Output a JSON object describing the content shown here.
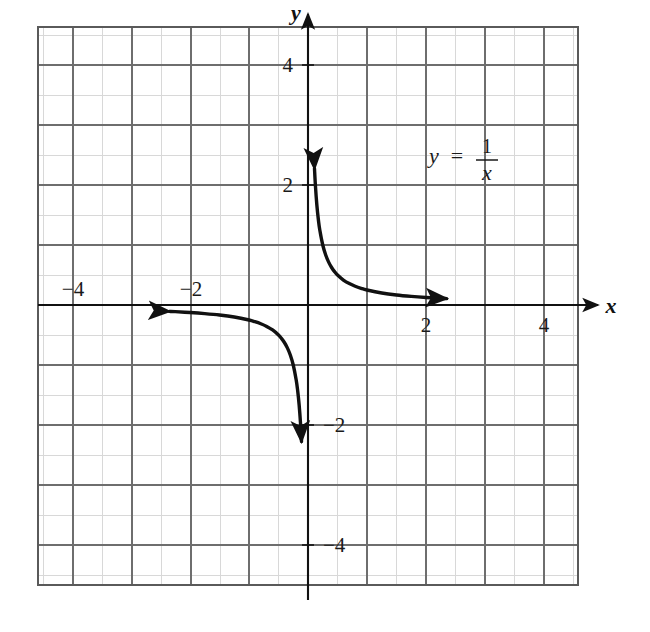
{
  "figure": {
    "background_color": "#ffffff",
    "curve_color": "#111111",
    "axis_color": "#111111",
    "major_grid_color": "#6e6e6e",
    "minor_grid_color": "#d8d8d8",
    "border_color": "#5a5a5a"
  },
  "axes": {
    "x_axis_name": "x",
    "y_axis_name": "y",
    "x_ticks_negative": [
      "−4",
      "−2"
    ],
    "x_ticks_positive": [
      "2",
      "4"
    ],
    "y_ticks_positive": [
      "4",
      "2"
    ],
    "y_ticks_negative": [
      "−2",
      "−4"
    ]
  },
  "equation": {
    "lhs": "y",
    "operator": "=",
    "numerator": "1",
    "denominator": "x",
    "full_text": "y = 1/x"
  },
  "chart_data": {
    "type": "line",
    "title": "",
    "subtitle": "",
    "xlabel": "x",
    "ylabel": "y",
    "xlim": [
      -5.0,
      5.0
    ],
    "ylim": [
      -5.1,
      5.1
    ],
    "grid": true,
    "minor_grid_step": 1,
    "major_grid_step": 2,
    "legend": "none",
    "xticks": [
      -4,
      -2,
      2,
      4
    ],
    "xticklabels": [
      "−4",
      "−2",
      "2",
      "4"
    ],
    "yticks": [
      4,
      2,
      -2,
      -4
    ],
    "yticklabels": [
      "4",
      "2",
      "−2",
      "−4"
    ],
    "annotations": [
      {
        "text": "y = 1/x",
        "x": 2.55,
        "y": 2.95
      }
    ],
    "series": [
      {
        "name": "y = 1/x (right branch, x > 0)",
        "equation": "y = 1/x",
        "arrow_start": true,
        "arrow_end": true,
        "x": [
          0.22,
          0.25,
          0.3,
          0.35,
          0.4,
          0.5,
          0.6,
          0.7,
          0.8,
          0.9,
          1.0,
          1.2,
          1.4,
          1.6,
          1.8,
          2.0,
          2.5,
          3.0,
          3.5,
          4.0,
          4.5,
          4.7
        ],
        "y": [
          4.55,
          4.0,
          3.333,
          2.857,
          2.5,
          2.0,
          1.667,
          1.429,
          1.25,
          1.111,
          1.0,
          0.833,
          0.714,
          0.625,
          0.556,
          0.5,
          0.4,
          0.333,
          0.286,
          0.25,
          0.222,
          0.213
        ]
      },
      {
        "name": "y = 1/x (left branch, x < 0)",
        "equation": "y = 1/x",
        "arrow_start": true,
        "arrow_end": true,
        "x": [
          -4.7,
          -4.5,
          -4.0,
          -3.5,
          -3.0,
          -2.5,
          -2.0,
          -1.8,
          -1.6,
          -1.4,
          -1.2,
          -1.0,
          -0.9,
          -0.8,
          -0.7,
          -0.6,
          -0.5,
          -0.4,
          -0.35,
          -0.3,
          -0.25,
          -0.22
        ],
        "y": [
          -0.213,
          -0.222,
          -0.25,
          -0.286,
          -0.333,
          -0.4,
          -0.5,
          -0.556,
          -0.625,
          -0.714,
          -0.833,
          -1.0,
          -1.111,
          -1.25,
          -1.429,
          -1.667,
          -2.0,
          -2.5,
          -2.857,
          -3.333,
          -4.0,
          -4.55
        ]
      }
    ]
  }
}
